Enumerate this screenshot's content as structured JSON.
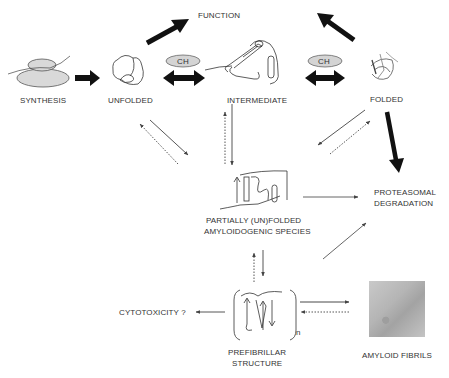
{
  "diagram": {
    "nodes": {
      "function": "FUNCTION",
      "synthesis": "SYNTHESIS",
      "unfolded": "UNFOLDED",
      "intermediate": "INTERMEDIATE",
      "folded": "FOLDED",
      "partially_line1": "PARTIALLY (UN)FOLDED",
      "partially_line2": "AMYLOIDOGENIC SPECIES",
      "proteasomal_line1": "PROTEASOMAL",
      "proteasomal_line2": "DEGRADATION",
      "cytotoxicity": "CYTOTOXICITY ?",
      "prefibrillar_line1": "PREFIBRILLAR",
      "prefibrillar_line2": "STRUCTURE",
      "amyloid_fibrils": "AMYLOID FIBRILS",
      "n_subscript": "n"
    },
    "chaperone_labels": [
      "CH",
      "CH"
    ],
    "colors": {
      "ink": "#222222",
      "thin_arrow": "#555555",
      "ch_fill": "#d4d4d4",
      "ellipse_fill": "#d9d9d9"
    }
  }
}
